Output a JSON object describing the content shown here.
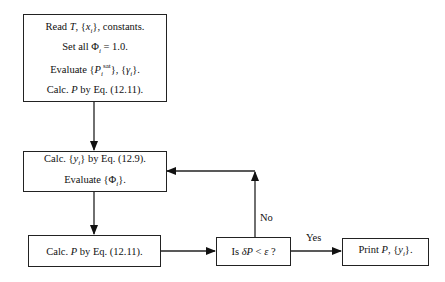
{
  "diagram": {
    "type": "flowchart",
    "nodes": {
      "init": {
        "lines": [
          "Read T, {xᵢ}, constants.",
          "Set all Φᵢ = 1.0.",
          "Evaluate {Pᵢˢᵃᵗ}, {γᵢ}.",
          "Calc. P by Eq. (12.11)."
        ]
      },
      "calc_y": {
        "lines": [
          "Calc. {yᵢ} by Eq. (12.9).",
          "Evaluate {Φᵢ}."
        ]
      },
      "calc_p": {
        "lines": [
          "Calc. P by Eq. (12.11)."
        ]
      },
      "decision": {
        "lines": [
          "Is δP < ε ?"
        ]
      },
      "print": {
        "lines": [
          "Print P, {yᵢ}."
        ]
      }
    },
    "edge_labels": {
      "no": "No",
      "yes": "Yes"
    },
    "edges": [
      {
        "from": "init",
        "to": "calc_y"
      },
      {
        "from": "calc_y",
        "to": "calc_p"
      },
      {
        "from": "calc_p",
        "to": "decision"
      },
      {
        "from": "decision",
        "to": "calc_y",
        "label": "No"
      },
      {
        "from": "decision",
        "to": "print",
        "label": "Yes"
      }
    ]
  }
}
